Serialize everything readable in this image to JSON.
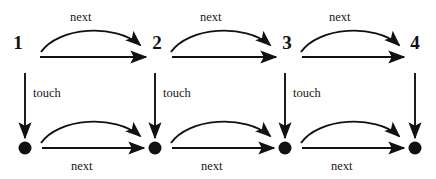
{
  "diagram": {
    "canvas": {
      "width": 436,
      "height": 179,
      "background": "#ffffff"
    },
    "stroke_color": "#111111",
    "top_row": {
      "nodes": [
        {
          "id": "n1",
          "label": "1",
          "x": 18,
          "y": 42
        },
        {
          "id": "n2",
          "label": "2",
          "x": 157,
          "y": 42
        },
        {
          "id": "n3",
          "label": "3",
          "x": 287,
          "y": 42
        },
        {
          "id": "n4",
          "label": "4",
          "x": 415,
          "y": 42
        }
      ],
      "straight_edges": [
        {
          "from": "n1",
          "to": "n2",
          "x1": 40,
          "y1": 57,
          "x2": 146,
          "y2": 57
        },
        {
          "from": "n2",
          "to": "n3",
          "x1": 172,
          "y1": 57,
          "x2": 276,
          "y2": 57
        },
        {
          "from": "n3",
          "to": "n4",
          "x1": 302,
          "y1": 57,
          "x2": 404,
          "y2": 57
        }
      ],
      "curved_edges": [
        {
          "from": "n1",
          "to": "n2",
          "label": "next",
          "label_x": 83,
          "label_y": 12
        },
        {
          "from": "n2",
          "to": "n3",
          "label": "next",
          "label_x": 213,
          "label_y": 12
        },
        {
          "from": "n3",
          "to": "n4",
          "label": "next",
          "label_x": 341,
          "label_y": 12
        }
      ]
    },
    "bottom_row": {
      "nodes": [
        {
          "id": "b1",
          "label": "",
          "x": 25,
          "y": 148,
          "radius": 6.5,
          "fill": "#111111"
        },
        {
          "id": "b2",
          "label": "",
          "x": 155,
          "y": 148,
          "radius": 6.5,
          "fill": "#111111"
        },
        {
          "id": "b3",
          "label": "",
          "x": 285,
          "y": 148,
          "radius": 6.5,
          "fill": "#111111"
        },
        {
          "id": "b4",
          "label": "",
          "x": 415,
          "y": 148,
          "radius": 6.5,
          "fill": "#111111"
        }
      ],
      "straight_edges": [
        {
          "from": "b1",
          "to": "b2",
          "label": "next",
          "label_x": 70,
          "label_y": 160,
          "x1": 42,
          "y1": 148,
          "x2": 144,
          "y2": 148
        },
        {
          "from": "b2",
          "to": "b3",
          "label": "next",
          "label_x": 200,
          "label_y": 160,
          "x1": 172,
          "y1": 148,
          "x2": 274,
          "y2": 148
        },
        {
          "from": "b3",
          "to": "b4",
          "label": "next",
          "label_x": 330,
          "label_y": 160,
          "x1": 302,
          "y1": 148,
          "x2": 404,
          "y2": 148
        }
      ],
      "curved_edges": [
        {
          "from": "b1",
          "to": "b2",
          "label": "",
          "label_x": 0,
          "label_y": 0
        },
        {
          "from": "b2",
          "to": "b3",
          "label": "",
          "label_x": 0,
          "label_y": 0
        },
        {
          "from": "b3",
          "to": "b4",
          "label": "",
          "label_x": 0,
          "label_y": 0
        }
      ]
    },
    "vertical_edges": [
      {
        "from": "n1",
        "to": "b1",
        "label": "touch",
        "label_x": 33,
        "label_y": 87,
        "x": 25,
        "y1": 73,
        "y2": 138
      },
      {
        "from": "n2",
        "to": "b2",
        "label": "touch",
        "label_x": 163,
        "label_y": 87,
        "x": 155,
        "y1": 73,
        "y2": 138
      },
      {
        "from": "n3",
        "to": "b3",
        "label": "touch",
        "label_x": 293,
        "label_y": 87,
        "x": 285,
        "y1": 73,
        "y2": 138
      },
      {
        "from": "n4",
        "to": "b4",
        "label": "",
        "label_x": 0,
        "label_y": 0,
        "x": 415,
        "y1": 73,
        "y2": 138
      }
    ]
  }
}
